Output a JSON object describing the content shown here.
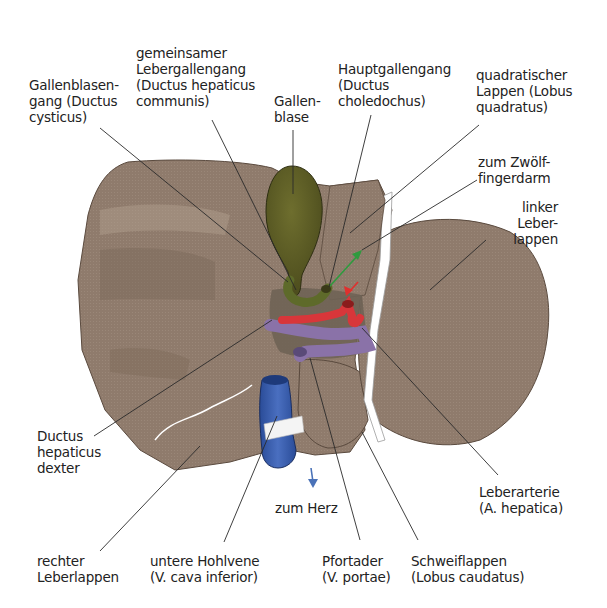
{
  "diagram": {
    "colors": {
      "liver": "#8f7b6c",
      "liver_light": "#a59282",
      "gallbladder": "#5c5c24",
      "artery": "#d8363a",
      "portal_vein": "#8a72a8",
      "vena_cava": "#2f56a6",
      "ligament": "#ffffff",
      "arrow_green": "#2f9a3e",
      "arrow_red": "#e0302e",
      "arrow_blue": "#4a72b8",
      "leader_line": "#2a2a2a"
    }
  },
  "labels": {
    "gallenblasengang": "Gallenblasen-\ngang (Ductus\ncysticus)",
    "gemeinsamer_lebergallengang": "gemeinsamer\nLebergallengang\n(Ductus hepaticus\ncommunis)",
    "gallenblase": "Gallen-\nblase",
    "hauptgallengang": "Hauptgallengang\n(Ductus\ncholedochus)",
    "quadratischer_lappen": "quadratischer\nLappen (Lobus\nquadratus)",
    "zum_zwoelffingerdarm": "zum Zwölf-\nfingerdarm",
    "linker_leberlappen": "linker\nLeber-\nlappen",
    "ductus_hepaticus_dexter": "Ductus\nhepaticus\ndexter",
    "leberarterie": "Leberarterie\n(A. hepatica)",
    "zum_herz": "zum Herz",
    "rechter_leberlappen": "rechter\nLeberlappen",
    "untere_hohlvene": "untere Hohlvene\n(V. cava inferior)",
    "pfortader": "Pfortader\n(V. portae)",
    "schweiflappen": "Schweiflappen\n(Lobus caudatus)"
  }
}
